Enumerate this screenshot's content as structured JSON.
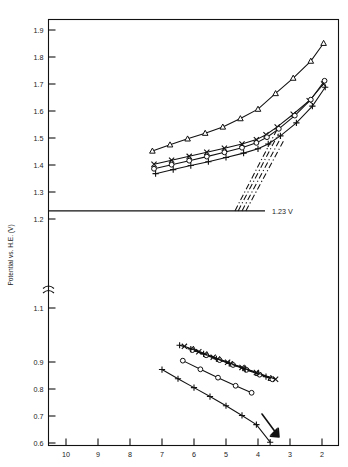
{
  "chart_data": {
    "type": "line",
    "title": "",
    "xlabel": "",
    "ylabel": "Potential vs. H.E. (V)",
    "xlim": [
      10.4,
      1.6
    ],
    "x_ticks": [
      10,
      9,
      8,
      7,
      6,
      5,
      4,
      3,
      2
    ],
    "x_tick_labels": [
      "10",
      "9",
      "8",
      "7",
      "6",
      "5",
      "4",
      "3",
      "2"
    ],
    "x_axis_inverted": true,
    "y_ticks_upper": [
      1.9,
      1.8,
      1.7,
      1.6,
      1.5,
      1.4,
      1.3,
      1.2
    ],
    "y_tick_labels_upper": [
      "1.9",
      "1.8",
      "1.7",
      "1.6",
      "1.5",
      "1.4",
      "1.3",
      "1.2"
    ],
    "y_ticks_lower": [
      1.1,
      0.9,
      0.8,
      0.7,
      0.6
    ],
    "y_tick_labels_lower": [
      "1.1",
      "0.9",
      "0.8",
      "0.7",
      "0.6"
    ],
    "axis_break": true,
    "axis_break_between": [
      1.2,
      1.1
    ],
    "grid": false,
    "legend": false,
    "annotations": [
      {
        "name": "equilibrium-line-label",
        "text": "1.23 V",
        "x": 3.6,
        "y": 1.23
      }
    ],
    "reference_lines": [
      {
        "name": "equilibrium-potential-line",
        "y": 1.23,
        "label": "1.23 V",
        "style": "solid"
      }
    ],
    "series": [
      {
        "name": "upper-triangle-series",
        "marker": "triangle",
        "line": "solid",
        "points": [
          {
            "x": 7.3,
            "y": 1.452
          },
          {
            "x": 6.75,
            "y": 1.475
          },
          {
            "x": 6.2,
            "y": 1.497
          },
          {
            "x": 5.65,
            "y": 1.518
          },
          {
            "x": 5.1,
            "y": 1.541
          },
          {
            "x": 4.55,
            "y": 1.572
          },
          {
            "x": 4.0,
            "y": 1.607
          },
          {
            "x": 3.45,
            "y": 1.665
          },
          {
            "x": 2.9,
            "y": 1.722
          },
          {
            "x": 2.35,
            "y": 1.785
          },
          {
            "x": 1.95,
            "y": 1.851
          }
        ]
      },
      {
        "name": "upper-cross-series",
        "marker": "cross",
        "line": "solid",
        "points": [
          {
            "x": 7.25,
            "y": 1.403
          },
          {
            "x": 6.7,
            "y": 1.418
          },
          {
            "x": 6.15,
            "y": 1.432
          },
          {
            "x": 5.6,
            "y": 1.447
          },
          {
            "x": 5.05,
            "y": 1.462
          },
          {
            "x": 4.5,
            "y": 1.478
          },
          {
            "x": 4.05,
            "y": 1.494
          },
          {
            "x": 3.75,
            "y": 1.512
          },
          {
            "x": 3.4,
            "y": 1.541
          },
          {
            "x": 2.9,
            "y": 1.588
          },
          {
            "x": 2.4,
            "y": 1.638
          },
          {
            "x": 1.95,
            "y": 1.7
          }
        ]
      },
      {
        "name": "upper-circle-series",
        "marker": "circle",
        "line": "solid",
        "points": [
          {
            "x": 7.25,
            "y": 1.386
          },
          {
            "x": 6.7,
            "y": 1.401
          },
          {
            "x": 6.15,
            "y": 1.416
          },
          {
            "x": 5.6,
            "y": 1.431
          },
          {
            "x": 5.05,
            "y": 1.447
          },
          {
            "x": 4.5,
            "y": 1.464
          },
          {
            "x": 4.05,
            "y": 1.482
          },
          {
            "x": 3.72,
            "y": 1.503
          },
          {
            "x": 3.35,
            "y": 1.534
          },
          {
            "x": 2.85,
            "y": 1.583
          },
          {
            "x": 2.35,
            "y": 1.642
          },
          {
            "x": 1.92,
            "y": 1.712
          }
        ]
      },
      {
        "name": "upper-plus-series",
        "marker": "plus",
        "line": "solid",
        "points": [
          {
            "x": 7.2,
            "y": 1.368
          },
          {
            "x": 6.65,
            "y": 1.383
          },
          {
            "x": 6.1,
            "y": 1.398
          },
          {
            "x": 5.55,
            "y": 1.412
          },
          {
            "x": 5.0,
            "y": 1.428
          },
          {
            "x": 4.45,
            "y": 1.444
          },
          {
            "x": 4.0,
            "y": 1.46
          },
          {
            "x": 3.68,
            "y": 1.478
          },
          {
            "x": 3.3,
            "y": 1.508
          },
          {
            "x": 2.8,
            "y": 1.556
          },
          {
            "x": 2.3,
            "y": 1.618
          },
          {
            "x": 1.9,
            "y": 1.688
          }
        ]
      },
      {
        "name": "extrapolation-line-1",
        "marker": "none",
        "line": "dashdot",
        "points": [
          {
            "x": 4.72,
            "y": 1.23
          },
          {
            "x": 3.42,
            "y": 1.528
          }
        ]
      },
      {
        "name": "extrapolation-line-2",
        "marker": "none",
        "line": "dashdot",
        "points": [
          {
            "x": 4.62,
            "y": 1.23
          },
          {
            "x": 3.36,
            "y": 1.516
          }
        ]
      },
      {
        "name": "extrapolation-line-3",
        "marker": "none",
        "line": "dashdot",
        "points": [
          {
            "x": 4.5,
            "y": 1.23
          },
          {
            "x": 3.28,
            "y": 1.503
          }
        ]
      },
      {
        "name": "extrapolation-line-4",
        "marker": "none",
        "line": "dashdot",
        "points": [
          {
            "x": 4.38,
            "y": 1.23
          },
          {
            "x": 3.2,
            "y": 1.49
          }
        ]
      },
      {
        "name": "lower-cluster-triangle-series",
        "marker": "triangle",
        "line": "solid",
        "points": [
          {
            "x": 6.02,
            "y": 0.948
          },
          {
            "x": 5.6,
            "y": 0.928
          },
          {
            "x": 5.2,
            "y": 0.91
          },
          {
            "x": 4.8,
            "y": 0.893
          },
          {
            "x": 4.4,
            "y": 0.876
          },
          {
            "x": 4.0,
            "y": 0.858
          },
          {
            "x": 3.6,
            "y": 0.84
          }
        ]
      },
      {
        "name": "lower-cluster-circle-series",
        "marker": "circle",
        "line": "solid",
        "points": [
          {
            "x": 6.05,
            "y": 0.944
          },
          {
            "x": 5.62,
            "y": 0.925
          },
          {
            "x": 5.2,
            "y": 0.907
          },
          {
            "x": 4.78,
            "y": 0.889
          },
          {
            "x": 4.36,
            "y": 0.871
          },
          {
            "x": 3.95,
            "y": 0.853
          },
          {
            "x": 3.55,
            "y": 0.836
          }
        ]
      },
      {
        "name": "lower-cluster-cross-series",
        "marker": "cross",
        "line": "solid",
        "points": [
          {
            "x": 6.3,
            "y": 0.958
          },
          {
            "x": 5.85,
            "y": 0.938
          },
          {
            "x": 5.4,
            "y": 0.918
          },
          {
            "x": 4.95,
            "y": 0.899
          },
          {
            "x": 4.5,
            "y": 0.88
          },
          {
            "x": 4.05,
            "y": 0.861
          },
          {
            "x": 3.45,
            "y": 0.836
          }
        ]
      },
      {
        "name": "lower-cluster-plus-series",
        "marker": "plus",
        "line": "dashed",
        "points": [
          {
            "x": 6.45,
            "y": 0.962
          },
          {
            "x": 6.1,
            "y": 0.948
          },
          {
            "x": 5.7,
            "y": 0.93
          },
          {
            "x": 5.3,
            "y": 0.912
          },
          {
            "x": 4.9,
            "y": 0.895
          },
          {
            "x": 4.4,
            "y": 0.873
          },
          {
            "x": 3.75,
            "y": 0.846
          }
        ]
      },
      {
        "name": "lower-circle-series",
        "marker": "circle",
        "line": "solid",
        "points": [
          {
            "x": 6.35,
            "y": 0.905
          },
          {
            "x": 5.8,
            "y": 0.873
          },
          {
            "x": 5.25,
            "y": 0.842
          },
          {
            "x": 4.7,
            "y": 0.812
          },
          {
            "x": 4.2,
            "y": 0.786
          }
        ]
      },
      {
        "name": "lower-plus-series",
        "marker": "plus",
        "line": "solid",
        "points": [
          {
            "x": 7.0,
            "y": 0.872
          },
          {
            "x": 6.5,
            "y": 0.838
          },
          {
            "x": 6.0,
            "y": 0.805
          },
          {
            "x": 5.5,
            "y": 0.772
          },
          {
            "x": 5.0,
            "y": 0.738
          },
          {
            "x": 4.5,
            "y": 0.702
          },
          {
            "x": 4.05,
            "y": 0.668
          },
          {
            "x": 3.62,
            "y": 0.603
          }
        ]
      }
    ]
  }
}
